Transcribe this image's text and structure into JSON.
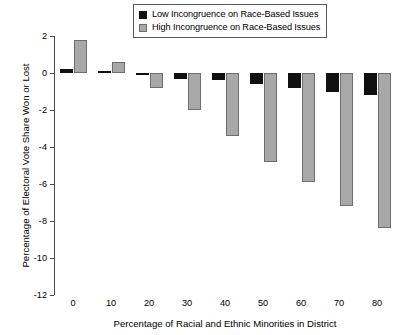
{
  "chart_data": {
    "type": "bar",
    "title": "",
    "xlabel": "Percentage of Racial and Ethnic Minorities in District",
    "ylabel": "Percentage of Electoral Vote Share Won or Lost",
    "categories": [
      "0",
      "10",
      "20",
      "30",
      "40",
      "50",
      "60",
      "70",
      "80"
    ],
    "series": [
      {
        "name": "Low Incongruence on Race-Based Issues",
        "color": "#111111",
        "values": [
          0.2,
          0.1,
          -0.1,
          -0.3,
          -0.4,
          -0.6,
          -0.8,
          -1.0,
          -1.2
        ]
      },
      {
        "name": "High Incongruence on Race-Based Issues",
        "color": "#a8a8a8",
        "values": [
          1.8,
          0.6,
          -0.8,
          -2.0,
          -3.4,
          -4.8,
          -5.9,
          -7.2,
          -8.4
        ]
      }
    ],
    "ylim": [
      -12,
      2
    ],
    "yticks": [
      "2",
      "0",
      "-2",
      "-4",
      "-6",
      "-8",
      "-10",
      "-12"
    ],
    "ytick_values": [
      2,
      0,
      -2,
      -4,
      -6,
      -8,
      -10,
      -12
    ],
    "xticks": [
      "0",
      "10",
      "20",
      "30",
      "40",
      "50",
      "60",
      "70",
      "80"
    ],
    "grid": false,
    "legend_position": "top-center"
  },
  "legend": {
    "items": [
      {
        "label": "Low Incongruence on Race-Based Issues",
        "swatch": "low"
      },
      {
        "label": "High Incongruence on Race-Based Issues",
        "swatch": "high"
      }
    ]
  }
}
